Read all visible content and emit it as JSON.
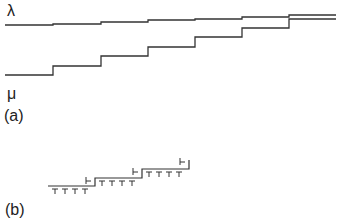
{
  "panel_a": {
    "label": "(a)",
    "upper_curve_label": "λ",
    "lower_curve_label": "μ",
    "upper_curve": {
      "name": "lambda",
      "steps_x": [
        5,
        53,
        101,
        148,
        195,
        242,
        289,
        336
      ],
      "levels_y": [
        25,
        23,
        22,
        20,
        19,
        17,
        15
      ]
    },
    "lower_curve": {
      "name": "mu",
      "steps_x": [
        5,
        53,
        101,
        148,
        195,
        242,
        289,
        336
      ],
      "levels_y": [
        75,
        66,
        56,
        47,
        37,
        28,
        19
      ]
    }
  },
  "panel_b": {
    "label": "(b)",
    "staircase": {
      "steps_x": [
        48,
        95,
        142,
        189
      ],
      "levels_y": [
        186,
        178,
        169
      ]
    },
    "t_markers_per_step": 4,
    "hook_marker": "Ͱ"
  }
}
